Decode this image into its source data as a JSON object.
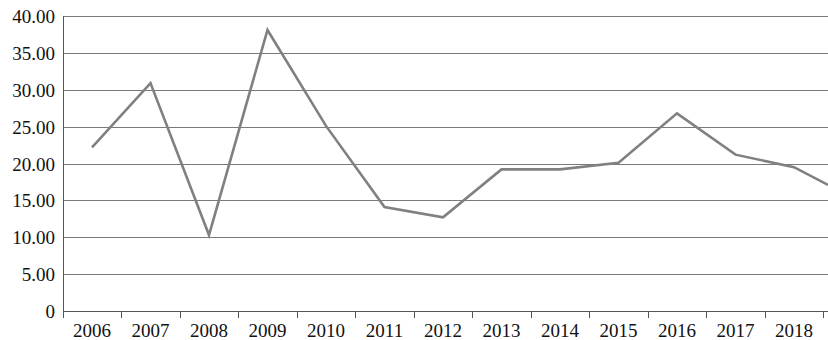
{
  "chart_data": {
    "type": "line",
    "title": "",
    "subtitle": "",
    "xlabel": "",
    "ylabel": "",
    "categories": [
      "2006",
      "2007",
      "2008",
      "2009",
      "2010",
      "2011",
      "2012",
      "2013",
      "2014",
      "2015",
      "2016",
      "2017",
      "2018"
    ],
    "values": [
      22.2,
      30.9,
      10.3,
      38.1,
      25.1,
      14.1,
      12.7,
      19.2,
      19.2,
      20.1,
      26.8,
      21.2,
      19.5
    ],
    "trailing_value": 17.1,
    "series": [
      {
        "name": "",
        "values": [
          22.2,
          30.9,
          10.3,
          38.1,
          25.1,
          14.1,
          12.7,
          19.2,
          19.2,
          20.1,
          26.8,
          21.2,
          19.5
        ],
        "color": "#808080"
      }
    ],
    "ylim": [
      0,
      40
    ],
    "ytick_values": [
      0,
      5,
      10,
      15,
      20,
      25,
      30,
      35,
      40
    ],
    "ytick_labels": [
      "0",
      "5.00",
      "10.00",
      "15.00",
      "20.00",
      "25.00",
      "30.00",
      "35.00",
      "40.00"
    ],
    "xtick_labels": [
      "2006",
      "2007",
      "2008",
      "2009",
      "2010",
      "2011",
      "2012",
      "2013",
      "2014",
      "2015",
      "2016",
      "2017",
      "2018"
    ],
    "grid": true,
    "grid_axis": "y",
    "legend": false,
    "legend_position": "none",
    "annotations": [],
    "colors": {
      "line": "#808080",
      "grid": "#7a7a7a",
      "axis": "#555555",
      "text": "#111111",
      "background": "#ffffff"
    }
  },
  "layout": {
    "plot_left": 63,
    "plot_right": 828,
    "plot_top": 16,
    "plot_bottom": 311,
    "category_step": 58.5,
    "first_category_x": 92
  }
}
